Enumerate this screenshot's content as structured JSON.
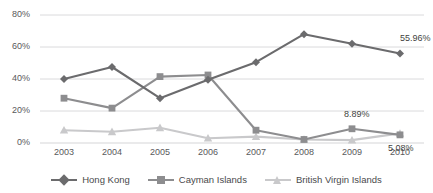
{
  "chart_data": {
    "type": "line",
    "title": "",
    "xlabel": "",
    "ylabel": "",
    "categories": [
      "2003",
      "2004",
      "2005",
      "2006",
      "2007",
      "2008",
      "2009",
      "2010"
    ],
    "ylim": [
      0,
      80
    ],
    "yticks": [
      "0%",
      "20%",
      "40%",
      "60%",
      "80%"
    ],
    "ytick_values": [
      0,
      20,
      40,
      60,
      80
    ],
    "grid": true,
    "legend_position": "bottom",
    "series": [
      {
        "name": "Hong Kong",
        "color": "#6b6b6d",
        "marker": "diamond",
        "values": [
          40.0,
          47.5,
          28.0,
          39.5,
          50.5,
          68.0,
          62.0,
          55.96
        ]
      },
      {
        "name": "Cayman Islands",
        "color": "#8d8d8f",
        "marker": "square",
        "values": [
          28.0,
          21.8,
          41.5,
          42.5,
          8.0,
          2.2,
          8.89,
          5.08
        ]
      },
      {
        "name": "British Virgin Islands",
        "color": "#c9c9cb",
        "marker": "triangle",
        "values": [
          8.0,
          7.0,
          9.5,
          3.0,
          4.0,
          2.2,
          1.8,
          6.0
        ]
      }
    ],
    "annotations": [
      {
        "text": "55.96%",
        "series": "Hong Kong",
        "category": "2010"
      },
      {
        "text": "8.89%",
        "series": "Cayman Islands",
        "category": "2009"
      },
      {
        "text": "5.08%",
        "series": "Cayman Islands",
        "category": "2010"
      }
    ]
  },
  "colors": {
    "hong_kong": "#6b6b6d",
    "cayman": "#8d8d8f",
    "bvi": "#c9c9cb",
    "grid": "#d6d6d8",
    "axis_text": "#59595b"
  }
}
